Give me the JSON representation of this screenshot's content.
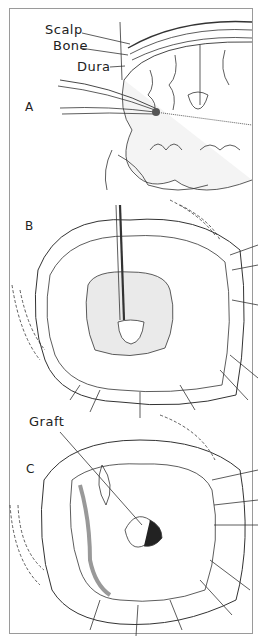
{
  "figure": {
    "panels": [
      {
        "id": "A",
        "label": "A",
        "annotations": [
          "Scalp",
          "Bone",
          "Dura"
        ]
      },
      {
        "id": "B",
        "label": "B"
      },
      {
        "id": "C",
        "label": "C",
        "annotations": [
          "Graft"
        ]
      }
    ]
  },
  "labels": {
    "scalp": "Scalp",
    "bone": "Bone",
    "dura": "Dura",
    "graft": "Graft",
    "panel_a": "A",
    "panel_b": "B",
    "panel_c": "C"
  }
}
